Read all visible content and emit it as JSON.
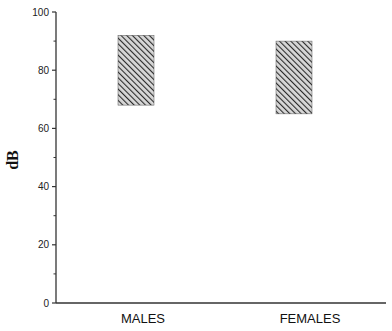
{
  "chart_data": {
    "type": "bar",
    "subtype": "floating-range",
    "title": "",
    "xlabel": "",
    "ylabel": "dB",
    "ylim": [
      0,
      100
    ],
    "yticks_major": [
      0,
      20,
      40,
      60,
      80,
      100
    ],
    "yticks_minor": [
      10,
      30,
      50,
      70,
      90
    ],
    "grid": false,
    "legend": null,
    "categories": [
      "MALES",
      "FEMALES"
    ],
    "series": [
      {
        "name": "range",
        "low": [
          68,
          65
        ],
        "high": [
          92,
          90
        ],
        "fill": "diagonal-hatch",
        "color": "#333333"
      }
    ]
  },
  "labels": {
    "y_axis_title": "dB",
    "y_ticks": [
      "0",
      "20",
      "40",
      "60",
      "80",
      "100"
    ],
    "categories": [
      "MALES",
      "FEMALES"
    ]
  }
}
